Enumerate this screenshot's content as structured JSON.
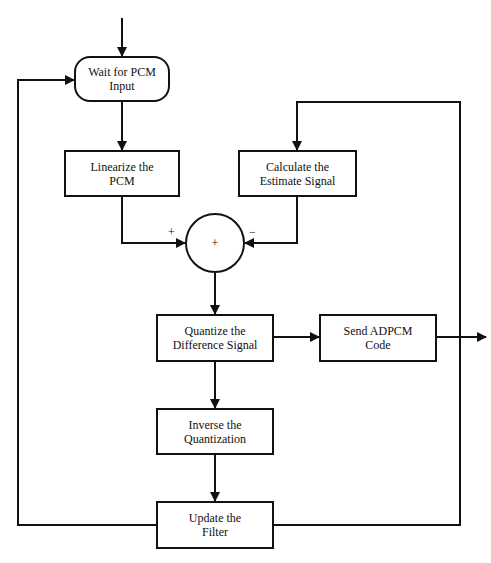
{
  "diagram": {
    "type": "flowchart",
    "nodes": {
      "wait": {
        "line1": "Wait for PCM",
        "line2": "Input",
        "shape": "rounded"
      },
      "linearize": {
        "line1": "Linearize the",
        "line2": "PCM",
        "shape": "rect"
      },
      "estimate": {
        "line1": "Calculate the",
        "line2": "Estimate Signal",
        "shape": "rect"
      },
      "summer": {
        "label": "+",
        "shape": "circle"
      },
      "quantize": {
        "line1": "Quantize the",
        "line2": "Difference Signal",
        "shape": "rect"
      },
      "send": {
        "line1": "Send ADPCM",
        "line2": "Code",
        "shape": "rect"
      },
      "inverse": {
        "line1": "Inverse the",
        "line2": "Quantization",
        "shape": "rect"
      },
      "update": {
        "line1": "Update the",
        "line2": "Filter",
        "shape": "rect"
      }
    },
    "signs": {
      "plus_input": "+",
      "minus_input": "−"
    },
    "edges": [
      {
        "from": "start",
        "to": "wait"
      },
      {
        "from": "wait",
        "to": "linearize"
      },
      {
        "from": "linearize",
        "to": "summer",
        "sign": "+"
      },
      {
        "from": "estimate",
        "to": "summer",
        "sign": "−"
      },
      {
        "from": "summer",
        "to": "quantize"
      },
      {
        "from": "quantize",
        "to": "send"
      },
      {
        "from": "send",
        "to": "output"
      },
      {
        "from": "quantize",
        "to": "inverse"
      },
      {
        "from": "inverse",
        "to": "update"
      },
      {
        "from": "update",
        "to": "wait"
      },
      {
        "from": "update",
        "to": "estimate"
      }
    ],
    "colors": {
      "stroke": "#111111",
      "background": "#ffffff"
    }
  }
}
